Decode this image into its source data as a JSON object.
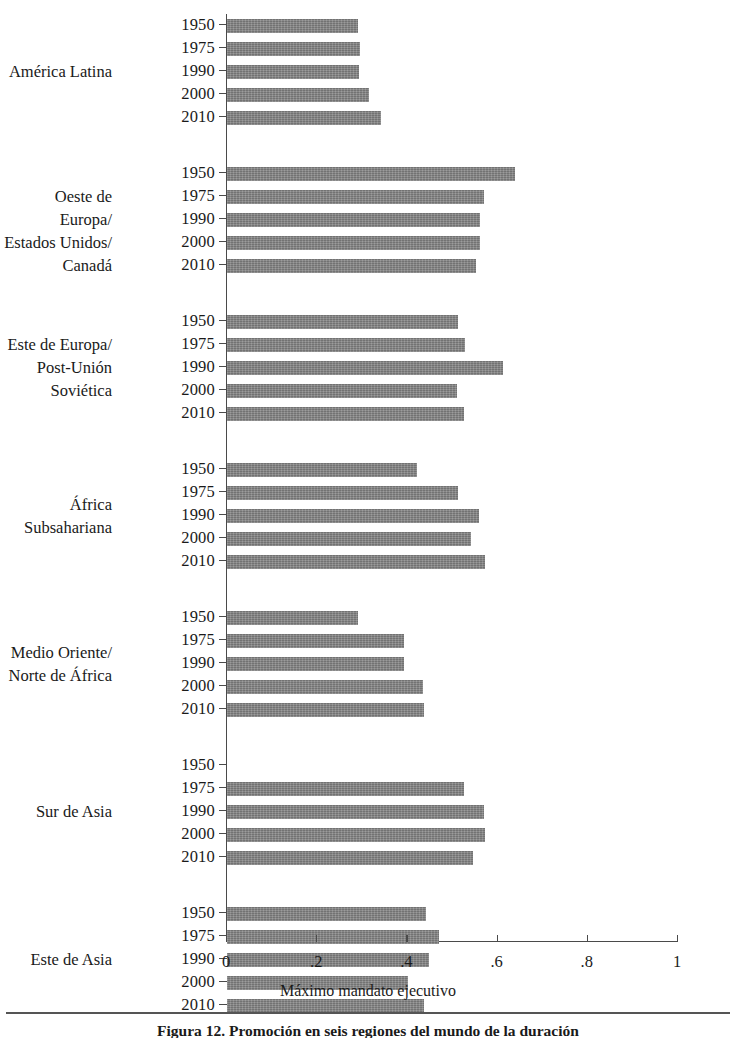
{
  "chart_data": {
    "type": "bar",
    "orientation": "horizontal",
    "title": "",
    "xlabel": "Máximo mandato ejecutivo",
    "ylabel": "",
    "xlim": [
      0,
      1
    ],
    "xticks": [
      "0",
      ".2",
      ".4",
      ".6",
      ".8",
      "1"
    ],
    "xtickvalues": [
      0,
      0.2,
      0.4,
      0.6,
      0.8,
      1
    ],
    "grid": false,
    "legend": "none",
    "series_years": [
      "1950",
      "1975",
      "1990",
      "2000",
      "2010"
    ],
    "groups": [
      {
        "label_lines": [
          "América Latina"
        ],
        "rows": [
          {
            "year": "1950",
            "value": 0.29
          },
          {
            "year": "1975",
            "value": 0.295
          },
          {
            "year": "1990",
            "value": 0.293
          },
          {
            "year": "2000",
            "value": 0.315
          },
          {
            "year": "2010",
            "value": 0.341
          }
        ]
      },
      {
        "label_lines": [
          "Oeste de Europa/",
          "Estados Unidos/",
          "Canadá"
        ],
        "rows": [
          {
            "year": "1950",
            "value": 0.639
          },
          {
            "year": "1975",
            "value": 0.569
          },
          {
            "year": "1990",
            "value": 0.561
          },
          {
            "year": "2000",
            "value": 0.561
          },
          {
            "year": "2010",
            "value": 0.552
          }
        ]
      },
      {
        "label_lines": [
          "Este de Europa/",
          "Post-Unión",
          "Soviética"
        ],
        "rows": [
          {
            "year": "1950",
            "value": 0.512
          },
          {
            "year": "1975",
            "value": 0.528
          },
          {
            "year": "1990",
            "value": 0.612
          },
          {
            "year": "2000",
            "value": 0.51
          },
          {
            "year": "2010",
            "value": 0.526
          }
        ]
      },
      {
        "label_lines": [
          "África",
          "Subsahariana"
        ],
        "rows": [
          {
            "year": "1950",
            "value": 0.421
          },
          {
            "year": "1975",
            "value": 0.512
          },
          {
            "year": "1990",
            "value": 0.559
          },
          {
            "year": "2000",
            "value": 0.541
          },
          {
            "year": "2010",
            "value": 0.572
          }
        ]
      },
      {
        "label_lines": [
          "Medio Oriente/",
          "Norte de África"
        ],
        "rows": [
          {
            "year": "1950",
            "value": 0.29
          },
          {
            "year": "1975",
            "value": 0.393
          },
          {
            "year": "1990",
            "value": 0.392
          },
          {
            "year": "2000",
            "value": 0.434
          },
          {
            "year": "2010",
            "value": 0.437
          }
        ]
      },
      {
        "label_lines": [
          "Sur de Asia"
        ],
        "rows": [
          {
            "year": "1950",
            "value": 0
          },
          {
            "year": "1975",
            "value": 0.525
          },
          {
            "year": "1990",
            "value": 0.57
          },
          {
            "year": "2000",
            "value": 0.572
          },
          {
            "year": "2010",
            "value": 0.545
          }
        ]
      },
      {
        "label_lines": [
          "Este de Asia"
        ],
        "rows": [
          {
            "year": "1950",
            "value": 0.441
          },
          {
            "year": "1975",
            "value": 0.47
          },
          {
            "year": "1990",
            "value": 0.447
          },
          {
            "year": "2000",
            "value": 0.402
          },
          {
            "year": "2010",
            "value": 0.437
          }
        ]
      }
    ]
  },
  "caption": {
    "text": "Figura 12. Promoción en seis regiones del mundo de la duración"
  },
  "colors": {
    "bar_fill": "#808080",
    "axis": "#4a4a4a",
    "text": "#1a1a1a",
    "background": "#ffffff"
  }
}
